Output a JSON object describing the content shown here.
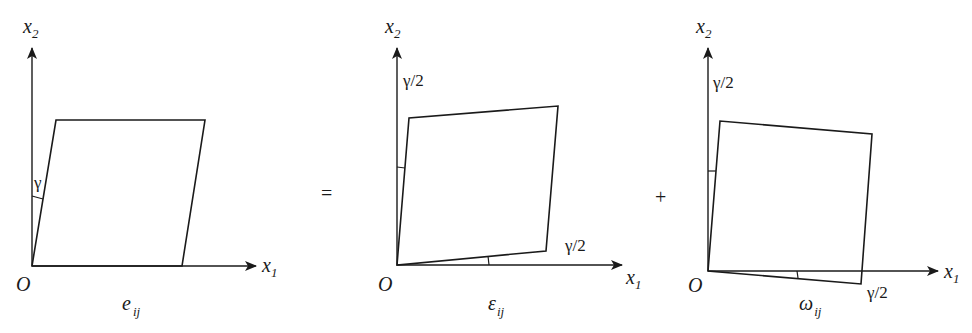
{
  "figure": {
    "operators": {
      "equals": "=",
      "plus": "+"
    },
    "panels": [
      {
        "id": "e",
        "axis_x_label": "x",
        "axis_x_sub": "1",
        "axis_y_label": "x",
        "axis_y_sub": "2",
        "origin_label": "O",
        "caption_main": "e",
        "caption_sub": "ij",
        "angle_labels": [
          "γ"
        ]
      },
      {
        "id": "epsilon",
        "axis_x_label": "x",
        "axis_x_sub": "1",
        "axis_y_label": "x",
        "axis_y_sub": "2",
        "origin_label": "O",
        "caption_main": "ε",
        "caption_sub": "ij",
        "angle_labels": [
          "γ/2",
          "γ/2"
        ]
      },
      {
        "id": "omega",
        "axis_x_label": "x",
        "axis_x_sub": "1",
        "axis_y_label": "x",
        "axis_y_sub": "2",
        "origin_label": "O",
        "caption_main": "ω",
        "caption_sub": "ij",
        "angle_labels": [
          "γ/2",
          "γ/2"
        ]
      }
    ]
  }
}
